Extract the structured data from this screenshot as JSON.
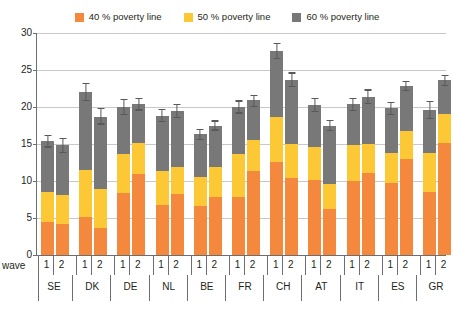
{
  "legend": {
    "items": [
      {
        "label": "40 % poverty line",
        "color": "#f4883c",
        "key": "p40"
      },
      {
        "label": "50 % poverty line",
        "color": "#fdc836",
        "key": "p50"
      },
      {
        "label": "60 % poverty line",
        "color": "#787878",
        "key": "p60"
      }
    ]
  },
  "axis": {
    "wave_label": "wave",
    "y_ticks": [
      "0",
      "5",
      "10",
      "15",
      "20",
      "25",
      "30"
    ]
  },
  "chart_data": {
    "type": "bar",
    "title": "",
    "subtitle": "",
    "xlabel": "wave",
    "ylabel": "",
    "ylim": [
      0,
      30
    ],
    "ytick_values": [
      0,
      5,
      10,
      15,
      20,
      25,
      30
    ],
    "grid": true,
    "stacked": true,
    "legend_position": "top-center",
    "legend_entries": [
      "40 % poverty line",
      "50 % poverty line",
      "60 % poverty line"
    ],
    "series": [
      {
        "name": "40 % poverty line",
        "color": "#f4883c"
      },
      {
        "name": "50 % poverty line",
        "color": "#fdc836"
      },
      {
        "name": "60 % poverty line",
        "color": "#787878"
      }
    ],
    "annotations": "Error bars show confidence intervals on the 60 % poverty line total.",
    "groups": [
      {
        "country": "SE",
        "bars": [
          {
            "wave": "1",
            "p40": 4.4,
            "p50": 8.5,
            "p60": 15.4,
            "err_low": 14.6,
            "err_high": 16.2
          },
          {
            "wave": "2",
            "p40": 4.2,
            "p50": 8.1,
            "p60": 14.8,
            "err_low": 13.9,
            "err_high": 15.7
          }
        ]
      },
      {
        "country": "DK",
        "bars": [
          {
            "wave": "1",
            "p40": 5.1,
            "p50": 11.5,
            "p60": 22.0,
            "err_low": 20.9,
            "err_high": 23.2
          },
          {
            "wave": "2",
            "p40": 3.7,
            "p50": 8.9,
            "p60": 18.7,
            "err_low": 17.7,
            "err_high": 19.8
          }
        ]
      },
      {
        "country": "DE",
        "bars": [
          {
            "wave": "1",
            "p40": 8.4,
            "p50": 13.7,
            "p60": 20.0,
            "err_low": 19.0,
            "err_high": 21.0
          },
          {
            "wave": "2",
            "p40": 10.9,
            "p50": 15.2,
            "p60": 20.4,
            "err_low": 19.6,
            "err_high": 21.2
          }
        ]
      },
      {
        "country": "NL",
        "bars": [
          {
            "wave": "1",
            "p40": 6.8,
            "p50": 11.3,
            "p60": 18.8,
            "err_low": 18.0,
            "err_high": 19.7
          },
          {
            "wave": "2",
            "p40": 8.2,
            "p50": 11.9,
            "p60": 19.4,
            "err_low": 18.6,
            "err_high": 20.3
          }
        ]
      },
      {
        "country": "BE",
        "bars": [
          {
            "wave": "1",
            "p40": 6.6,
            "p50": 10.5,
            "p60": 16.3,
            "err_low": 15.6,
            "err_high": 17.0
          },
          {
            "wave": "2",
            "p40": 7.9,
            "p50": 11.9,
            "p60": 17.5,
            "err_low": 16.9,
            "err_high": 18.1
          }
        ]
      },
      {
        "country": "FR",
        "bars": [
          {
            "wave": "1",
            "p40": 7.9,
            "p50": 13.7,
            "p60": 20.0,
            "err_low": 19.2,
            "err_high": 20.8
          },
          {
            "wave": "2",
            "p40": 11.4,
            "p50": 15.5,
            "p60": 20.9,
            "err_low": 20.1,
            "err_high": 21.6
          }
        ]
      },
      {
        "country": "CH",
        "bars": [
          {
            "wave": "1",
            "p40": 12.6,
            "p50": 18.6,
            "p60": 27.6,
            "err_low": 26.6,
            "err_high": 28.6
          },
          {
            "wave": "2",
            "p40": 10.4,
            "p50": 15.0,
            "p60": 23.7,
            "err_low": 22.8,
            "err_high": 24.6
          }
        ]
      },
      {
        "country": "AT",
        "bars": [
          {
            "wave": "1",
            "p40": 10.1,
            "p50": 14.6,
            "p60": 20.3,
            "err_low": 19.4,
            "err_high": 21.1
          },
          {
            "wave": "2",
            "p40": 6.2,
            "p50": 9.6,
            "p60": 17.5,
            "err_low": 16.8,
            "err_high": 18.2
          }
        ]
      },
      {
        "country": "IT",
        "bars": [
          {
            "wave": "1",
            "p40": 10.0,
            "p50": 14.9,
            "p60": 20.4,
            "err_low": 19.5,
            "err_high": 21.2
          },
          {
            "wave": "2",
            "p40": 11.1,
            "p50": 15.0,
            "p60": 21.4,
            "err_low": 20.5,
            "err_high": 22.3
          }
        ]
      },
      {
        "country": "ES",
        "bars": [
          {
            "wave": "1",
            "p40": 9.7,
            "p50": 13.8,
            "p60": 19.8,
            "err_low": 19.0,
            "err_high": 20.6
          },
          {
            "wave": "2",
            "p40": 13.0,
            "p50": 16.7,
            "p60": 22.9,
            "err_low": 22.2,
            "err_high": 23.5
          }
        ]
      },
      {
        "country": "GR",
        "bars": [
          {
            "wave": "1",
            "p40": 8.5,
            "p50": 13.8,
            "p60": 19.6,
            "err_low": 18.5,
            "err_high": 20.7
          },
          {
            "wave": "2",
            "p40": 15.2,
            "p50": 19.1,
            "p60": 23.6,
            "err_low": 22.9,
            "err_high": 24.3
          }
        ]
      },
      {
        "country": "CZ",
        "bars": [
          {
            "wave": "2",
            "p40": 6.3,
            "p50": 9.0,
            "p60": 13.5,
            "err_low": 12.9,
            "err_high": 14.2
          }
        ]
      },
      {
        "country": "PL",
        "bars": [
          {
            "wave": "2",
            "p40": 12.8,
            "p50": 17.6,
            "p60": 23.8,
            "err_low": 23.1,
            "err_high": 24.5
          }
        ]
      }
    ]
  }
}
